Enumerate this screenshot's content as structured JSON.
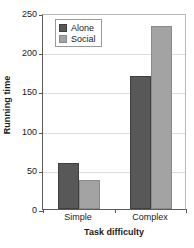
{
  "chart_data": {
    "type": "bar",
    "title": "",
    "xlabel": "Task difficulty",
    "ylabel": "Running time",
    "categories": [
      "Simple",
      "Complex"
    ],
    "series": [
      {
        "name": "Alone",
        "color": "#585858",
        "values": [
          59,
          170
        ]
      },
      {
        "name": "Social",
        "color": "#a3a3a3",
        "values": [
          37,
          233
        ]
      }
    ],
    "ylim": [
      0,
      250
    ],
    "yticks": [
      0,
      50,
      100,
      150,
      200,
      250
    ],
    "ytick_labels": [
      "0",
      "50",
      "100",
      "150",
      "200",
      "250"
    ],
    "grid": true,
    "grid_axis": "y",
    "legend_position": "top-left-inside",
    "legend_entries": [
      "Alone",
      "Social"
    ]
  },
  "axes": {
    "y_title": "Running time",
    "x_title": "Task difficulty"
  }
}
